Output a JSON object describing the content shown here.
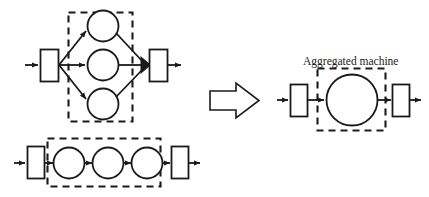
{
  "figure": {
    "background_color": "#ffffff",
    "stroke_color": "#1a1a1a",
    "width": 429,
    "height": 197
  },
  "labels": {
    "aggregated_machine": "Aggregated machine"
  },
  "left_panel": {
    "parallel_model": {
      "name": "parallel-machines-model",
      "input_place": {
        "label": "",
        "shape": "rectangle"
      },
      "output_place": {
        "label": "",
        "shape": "rectangle"
      },
      "split_node": {
        "shape": "fan-out"
      },
      "join_node": {
        "shape": "filled-triangle"
      },
      "machines": [
        {
          "label": "",
          "shape": "circle",
          "branch": "top"
        },
        {
          "label": "",
          "shape": "circle",
          "branch": "middle"
        },
        {
          "label": "",
          "shape": "circle",
          "branch": "bottom"
        }
      ],
      "grouping_box": {
        "style": "dashed",
        "encloses": "machines"
      }
    },
    "serial_model": {
      "name": "serial-machines-model",
      "input_place": {
        "label": "",
        "shape": "rectangle"
      },
      "output_place": {
        "label": "",
        "shape": "rectangle"
      },
      "machines": [
        {
          "label": "",
          "shape": "circle",
          "position": 1
        },
        {
          "label": "",
          "shape": "circle",
          "position": 2
        },
        {
          "label": "",
          "shape": "circle",
          "position": 3
        }
      ],
      "grouping_box": {
        "style": "dashed",
        "encloses": "machines"
      }
    }
  },
  "transform_arrow": {
    "name": "implies-block-arrow",
    "glyph": "=>",
    "direction": "right"
  },
  "right_panel": {
    "aggregated_model": {
      "name": "aggregated-machine-model",
      "input_place": {
        "label": "",
        "shape": "rectangle"
      },
      "output_place": {
        "label": "",
        "shape": "rectangle"
      },
      "machine": {
        "label": "",
        "shape": "circle"
      },
      "grouping_box": {
        "style": "dashed",
        "encloses": "machine",
        "caption": "Aggregated machine"
      }
    }
  }
}
